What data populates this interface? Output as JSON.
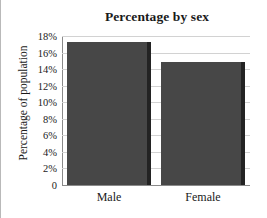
{
  "chart_data": {
    "type": "bar",
    "title": "Percentage by sex",
    "xlabel": "",
    "ylabel": "Percentage of population",
    "categories": [
      "Male",
      "Female"
    ],
    "values": [
      17.3,
      14.9
    ],
    "ylim": [
      0,
      18
    ],
    "ytick_values": [
      0,
      2,
      4,
      6,
      8,
      10,
      12,
      14,
      16,
      18
    ],
    "ytick_labels": [
      "0",
      "2%",
      "4%",
      "6%",
      "8%",
      "10%",
      "12%",
      "14%",
      "16%",
      "18%"
    ],
    "grid": "horizontal",
    "legend": "none",
    "bar_color": "#474747",
    "bar_shadow_color": "#232323",
    "gridline_color": "#d2d2d2",
    "axis_color": "#8a8a8a",
    "text_color": "#1a1a1a"
  }
}
